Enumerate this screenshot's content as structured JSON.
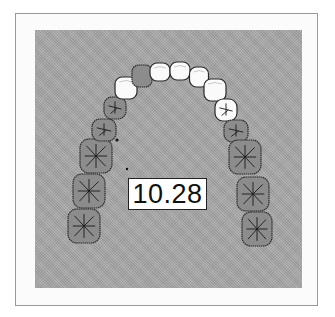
{
  "figure": {
    "measurement_label": "10.28",
    "colors": {
      "background": "#a9a9a9",
      "tooth_white": "#fafafa",
      "tooth_dark": "#8c8c8c",
      "outline": "#2a2a2a",
      "frame": "#9a9a9a"
    },
    "teeth": [
      {
        "id": "left-molar-3",
        "side": "left",
        "type": "molar",
        "shade": "dark",
        "cx": 84,
        "cy": 226,
        "w": 32,
        "h": 34
      },
      {
        "id": "left-molar-2",
        "side": "left",
        "type": "molar",
        "shade": "dark",
        "cx": 89,
        "cy": 191,
        "w": 32,
        "h": 34
      },
      {
        "id": "left-molar-1",
        "side": "left",
        "type": "molar",
        "shade": "dark",
        "cx": 96,
        "cy": 156,
        "w": 32,
        "h": 34
      },
      {
        "id": "left-premolar-2",
        "side": "left",
        "type": "premolar",
        "shade": "dark",
        "cx": 104,
        "cy": 130,
        "w": 24,
        "h": 22
      },
      {
        "id": "left-premolar-1",
        "side": "left",
        "type": "premolar",
        "shade": "dark",
        "cx": 115,
        "cy": 108,
        "w": 22,
        "h": 22
      },
      {
        "id": "left-canine",
        "side": "left",
        "type": "canine",
        "shade": "white",
        "cx": 126,
        "cy": 88,
        "w": 22,
        "h": 22
      },
      {
        "id": "left-lateral-incisor",
        "side": "left",
        "type": "incisor",
        "shade": "dark",
        "cx": 142,
        "cy": 76,
        "w": 20,
        "h": 22
      },
      {
        "id": "left-central-incisor",
        "side": "left",
        "type": "incisor",
        "shade": "white",
        "cx": 160,
        "cy": 72,
        "w": 20,
        "h": 18
      },
      {
        "id": "right-central-incisor",
        "side": "right",
        "type": "incisor",
        "shade": "white",
        "cx": 180,
        "cy": 71,
        "w": 20,
        "h": 18
      },
      {
        "id": "right-lateral-incisor",
        "side": "right",
        "type": "incisor",
        "shade": "white",
        "cx": 199,
        "cy": 77,
        "w": 19,
        "h": 20
      },
      {
        "id": "right-canine",
        "side": "right",
        "type": "canine",
        "shade": "white",
        "cx": 215,
        "cy": 90,
        "w": 22,
        "h": 22
      },
      {
        "id": "right-premolar-1",
        "side": "right",
        "type": "premolar",
        "shade": "white",
        "cx": 226,
        "cy": 110,
        "w": 22,
        "h": 22
      },
      {
        "id": "right-premolar-2",
        "side": "right",
        "type": "premolar",
        "shade": "dark",
        "cx": 236,
        "cy": 131,
        "w": 24,
        "h": 22
      },
      {
        "id": "right-molar-1",
        "side": "right",
        "type": "molar",
        "shade": "dark",
        "cx": 245,
        "cy": 157,
        "w": 32,
        "h": 34
      },
      {
        "id": "right-molar-2",
        "side": "right",
        "type": "molar",
        "shade": "dark",
        "cx": 253,
        "cy": 194,
        "w": 32,
        "h": 34
      },
      {
        "id": "right-molar-3",
        "side": "right",
        "type": "molar",
        "shade": "dark",
        "cx": 257,
        "cy": 229,
        "w": 30,
        "h": 34
      }
    ]
  }
}
